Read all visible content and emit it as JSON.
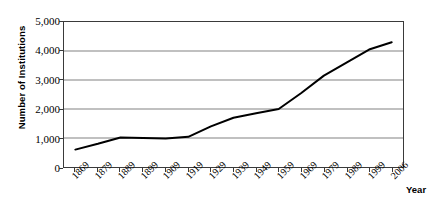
{
  "chart_data": {
    "type": "line",
    "title": "",
    "subtitle": "",
    "xlabel": "Year",
    "ylabel": "Number of Institutions",
    "categories": [
      "1869",
      "1879",
      "1889",
      "1899",
      "1909",
      "1919",
      "1929",
      "1939",
      "1949",
      "1959",
      "1969",
      "1979",
      "1989",
      "1999",
      "2006"
    ],
    "values": [
      600,
      800,
      1020,
      1000,
      980,
      1040,
      1400,
      1700,
      1850,
      2000,
      2550,
      3150,
      3600,
      4050,
      4300
    ],
    "series": [
      {
        "name": "Number of Institutions",
        "values": [
          600,
          800,
          1020,
          1000,
          980,
          1040,
          1400,
          1700,
          1850,
          2000,
          2550,
          3150,
          3600,
          4050,
          4300
        ],
        "color": "#000000"
      }
    ],
    "ylim": [
      0,
      5000
    ],
    "y_ticks": [
      0,
      1000,
      2000,
      3000,
      4000,
      5000
    ],
    "y_tick_labels": [
      "0",
      "1,000",
      "2,000",
      "3,000",
      "4,000",
      "5,000"
    ],
    "grid": "horizontal",
    "legend": "none",
    "line_color": "#000000",
    "grid_color": "#808080",
    "axis_color": "#3a3a3a",
    "background": "#ffffff"
  }
}
